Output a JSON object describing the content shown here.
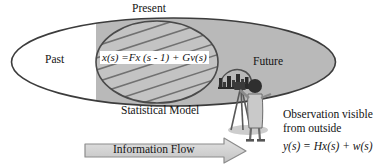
{
  "diagram": {
    "title_label": "Present",
    "regions": {
      "past": "Past",
      "future": "Future",
      "present": "Present"
    },
    "inner_ellipse": {
      "caption": "Statistical Model",
      "equation": "x(s) =Fx (s - 1) + Gv(s)"
    },
    "observer": {
      "note_line1": "Observation visible",
      "note_line2": "from outside",
      "equation": "y(s) = Hx(s) + w(s)",
      "figure_icon": "photographer-with-tripod-camera",
      "scene_icon": "cityscape-skyline"
    },
    "arrow": {
      "label": "Information Flow",
      "direction": "right"
    },
    "colors": {
      "gray_fill": "#b8b8b8",
      "outline": "#3c3c3c",
      "hatch": "#6e6e6e",
      "arrow_fill": "#cfcfcf",
      "arrow_outline": "#7a7a7a",
      "background": "#ffffff",
      "text": "#141414"
    }
  }
}
